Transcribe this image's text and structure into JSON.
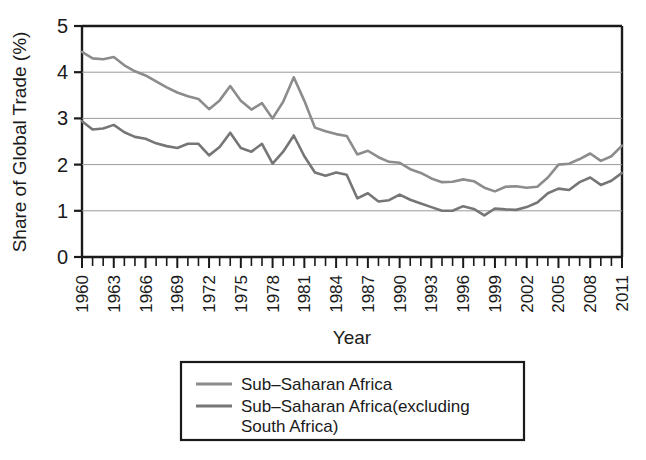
{
  "chart_data": {
    "type": "line",
    "title": "",
    "xlabel": "Year",
    "ylabel": "Share of Global Trade (%)",
    "xlim": [
      1960,
      2011
    ],
    "ylim": [
      0,
      5
    ],
    "yticks": [
      0,
      1,
      2,
      3,
      4,
      5
    ],
    "ytick_labels": [
      "0",
      "1",
      "2",
      "3",
      "4",
      "5"
    ],
    "xticks": [
      1960,
      1963,
      1966,
      1969,
      1972,
      1975,
      1978,
      1981,
      1984,
      1987,
      1990,
      1993,
      1996,
      1999,
      2002,
      2005,
      2008,
      2011
    ],
    "xtick_labels": [
      "1960",
      "1963",
      "1966",
      "1969",
      "1972",
      "1975",
      "1978",
      "1981",
      "1984",
      "1987",
      "1990",
      "1993",
      "1996",
      "1999",
      "2002",
      "2005",
      "2008",
      "2011"
    ],
    "xtick_rotation": 90,
    "minor_xticks_every": 1,
    "grid": "horizontal",
    "grid_color": "#9a9a9a",
    "legend_position": "below-axes",
    "x": [
      1960,
      1961,
      1962,
      1963,
      1964,
      1965,
      1966,
      1967,
      1968,
      1969,
      1970,
      1971,
      1972,
      1973,
      1974,
      1975,
      1976,
      1977,
      1978,
      1979,
      1980,
      1981,
      1982,
      1983,
      1984,
      1985,
      1986,
      1987,
      1988,
      1989,
      1990,
      1991,
      1992,
      1993,
      1994,
      1995,
      1996,
      1997,
      1998,
      1999,
      2000,
      2001,
      2002,
      2003,
      2004,
      2005,
      2006,
      2007,
      2008,
      2009,
      2010,
      2011
    ],
    "series": [
      {
        "name": "Sub-Saharan Africa",
        "color": "#8c8c8c",
        "linewidth": 2.6,
        "values": [
          4.44,
          4.3,
          4.28,
          4.33,
          4.15,
          4.02,
          3.93,
          3.8,
          3.67,
          3.56,
          3.48,
          3.42,
          3.2,
          3.39,
          3.7,
          3.38,
          3.19,
          3.33,
          3.0,
          3.36,
          3.89,
          3.38,
          2.8,
          2.72,
          2.66,
          2.62,
          2.22,
          2.3,
          2.16,
          2.06,
          2.04,
          1.9,
          1.82,
          1.7,
          1.62,
          1.63,
          1.68,
          1.64,
          1.5,
          1.42,
          1.52,
          1.53,
          1.5,
          1.52,
          1.72,
          2.0,
          2.02,
          2.12,
          2.24,
          2.08,
          2.18,
          2.41
        ]
      },
      {
        "name": "Sub-Saharan Africa(excluding South Africa)",
        "color": "#767676",
        "linewidth": 2.6,
        "values": [
          2.94,
          2.76,
          2.78,
          2.86,
          2.7,
          2.6,
          2.56,
          2.46,
          2.4,
          2.36,
          2.45,
          2.45,
          2.2,
          2.38,
          2.69,
          2.36,
          2.28,
          2.45,
          2.02,
          2.28,
          2.63,
          2.18,
          1.83,
          1.76,
          1.83,
          1.78,
          1.27,
          1.38,
          1.2,
          1.23,
          1.35,
          1.24,
          1.16,
          1.08,
          1.0,
          1.0,
          1.1,
          1.04,
          0.9,
          1.05,
          1.03,
          1.02,
          1.08,
          1.18,
          1.38,
          1.48,
          1.45,
          1.62,
          1.72,
          1.56,
          1.65,
          1.82
        ]
      }
    ]
  },
  "legend": {
    "entries": [
      {
        "label": "Sub–Saharan Africa"
      },
      {
        "label": "Sub–Saharan Africa(excluding"
      },
      {
        "label": "South Africa)"
      }
    ]
  },
  "axes": {
    "y_axis_title": "Share of Global Trade (%)",
    "x_axis_title": "Year"
  }
}
